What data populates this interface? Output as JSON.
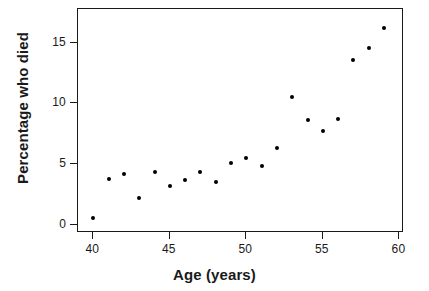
{
  "chart_data": {
    "type": "scatter",
    "title": "",
    "xlabel": "Age (years)",
    "ylabel": "Percentage who died",
    "xlim": [
      39.0,
      60.3
    ],
    "ylim": [
      -0.7,
      17.8
    ],
    "xticks": [
      40,
      45,
      50,
      55,
      60
    ],
    "yticks": [
      0,
      5,
      10,
      15
    ],
    "xtick_labels": [
      "40",
      "45",
      "50",
      "55",
      "60"
    ],
    "ytick_labels": [
      "0",
      "5",
      "10",
      "15"
    ],
    "grid": false,
    "legend": null,
    "marker": {
      "shape": "circle",
      "color": "#000000",
      "size_px": 4
    },
    "series": [
      {
        "name": "Percentage who died by age",
        "x": [
          40,
          41,
          42,
          43,
          44,
          45,
          46,
          47,
          48,
          49,
          50,
          51,
          52,
          53,
          54,
          55,
          56,
          57,
          58,
          59
        ],
        "y": [
          0.5,
          3.8,
          4.2,
          2.2,
          4.3,
          3.2,
          3.7,
          4.3,
          3.5,
          5.1,
          5.5,
          4.8,
          6.3,
          10.5,
          8.6,
          7.7,
          8.7,
          13.6,
          14.6,
          16.2
        ]
      }
    ]
  },
  "style": {
    "background": "#ffffff",
    "axis_color": "#1a1a1a",
    "point_color": "#000000"
  }
}
